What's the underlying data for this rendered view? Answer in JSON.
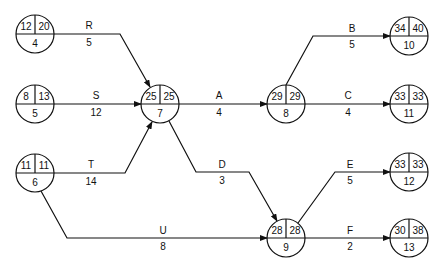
{
  "diagram": {
    "type": "activity-on-arrow network (PERT/CPM)",
    "nodes": [
      {
        "id": "4",
        "es": "12",
        "lf": "20",
        "x": 35,
        "y": 34
      },
      {
        "id": "5",
        "es": "8",
        "lf": "13",
        "x": 35,
        "y": 104
      },
      {
        "id": "6",
        "es": "11",
        "lf": "11",
        "x": 35,
        "y": 173
      },
      {
        "id": "7",
        "es": "25",
        "lf": "25",
        "x": 160,
        "y": 104
      },
      {
        "id": "8",
        "es": "29",
        "lf": "29",
        "x": 286,
        "y": 104
      },
      {
        "id": "9",
        "es": "28",
        "lf": "28",
        "x": 286,
        "y": 238
      },
      {
        "id": "10",
        "es": "34",
        "lf": "40",
        "x": 409,
        "y": 34
      },
      {
        "id": "11",
        "es": "33",
        "lf": "33",
        "x": 409,
        "y": 104
      },
      {
        "id": "12",
        "es": "33",
        "lf": "33",
        "x": 409,
        "y": 172
      },
      {
        "id": "13",
        "es": "30",
        "lf": "38",
        "x": 409,
        "y": 238
      }
    ],
    "activities": [
      {
        "name": "R",
        "duration": "5",
        "from": "4",
        "to": "7"
      },
      {
        "name": "S",
        "duration": "12",
        "from": "5",
        "to": "7"
      },
      {
        "name": "T",
        "duration": "14",
        "from": "6",
        "to": "7"
      },
      {
        "name": "U",
        "duration": "8",
        "from": "6",
        "to": "9"
      },
      {
        "name": "A",
        "duration": "4",
        "from": "7",
        "to": "8"
      },
      {
        "name": "D",
        "duration": "3",
        "from": "7",
        "to": "9"
      },
      {
        "name": "B",
        "duration": "5",
        "from": "8",
        "to": "10"
      },
      {
        "name": "C",
        "duration": "4",
        "from": "8",
        "to": "11"
      },
      {
        "name": "E",
        "duration": "5",
        "from": "9",
        "to": "12"
      },
      {
        "name": "F",
        "duration": "2",
        "from": "9",
        "to": "13"
      }
    ]
  }
}
